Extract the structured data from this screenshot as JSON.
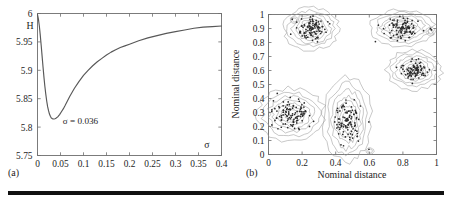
{
  "figure": {
    "bottom_rule_color": "#111111",
    "background": "#ffffff"
  },
  "panel_a": {
    "caption": "(a)",
    "y_axis_symbol": "H",
    "x_axis_symbol": "σ",
    "annotation": "σ = 0.036",
    "x_ticks": [
      "0",
      "0.05",
      "0.1",
      "0.15",
      "0.2",
      "0.25",
      "0.3",
      "0.35",
      "0.4"
    ],
    "y_ticks": [
      "5.75",
      "5.8",
      "5.85",
      "5.9",
      "5.95",
      "6"
    ]
  },
  "panel_b": {
    "caption": "(b)",
    "x_title": "Nominal distance",
    "y_title": "Nominal distance",
    "x_ticks": [
      "0",
      "0.2",
      "0.4",
      "0.6",
      "0.8",
      "1"
    ],
    "y_ticks": [
      "0",
      "0.1",
      "0.2",
      "0.3",
      "0.4",
      "0.5",
      "0.6",
      "0.7",
      "0.8",
      "0.9",
      "1"
    ]
  },
  "chart_data": [
    {
      "type": "line",
      "panel": "(a)",
      "title": "",
      "xlabel": "σ",
      "ylabel": "H",
      "xlim": [
        0,
        0.4
      ],
      "ylim": [
        5.75,
        6.0
      ],
      "grid": false,
      "legend": null,
      "annotations": [
        {
          "text": "σ = 0.036",
          "x": 0.055,
          "y": 5.805,
          "note": "marks the location of the curve minimum"
        }
      ],
      "series": [
        {
          "name": "H(σ)",
          "color": "#585858",
          "x": [
            0.0,
            0.002,
            0.004,
            0.006,
            0.008,
            0.01,
            0.012,
            0.014,
            0.016,
            0.018,
            0.02,
            0.022,
            0.024,
            0.026,
            0.028,
            0.03,
            0.032,
            0.034,
            0.036,
            0.038,
            0.04,
            0.044,
            0.048,
            0.052,
            0.056,
            0.06,
            0.065,
            0.07,
            0.075,
            0.08,
            0.09,
            0.1,
            0.11,
            0.12,
            0.13,
            0.14,
            0.15,
            0.16,
            0.17,
            0.18,
            0.19,
            0.2,
            0.22,
            0.24,
            0.26,
            0.28,
            0.3,
            0.32,
            0.34,
            0.36,
            0.38,
            0.4
          ],
          "y": [
            5.998,
            5.99,
            5.978,
            5.962,
            5.944,
            5.925,
            5.906,
            5.888,
            5.872,
            5.858,
            5.846,
            5.836,
            5.829,
            5.823,
            5.819,
            5.816,
            5.815,
            5.8145,
            5.8143,
            5.8147,
            5.8155,
            5.818,
            5.822,
            5.827,
            5.832,
            5.838,
            5.846,
            5.854,
            5.861,
            5.868,
            5.88,
            5.891,
            5.9,
            5.908,
            5.915,
            5.921,
            5.927,
            5.932,
            5.936,
            5.94,
            5.943,
            5.946,
            5.952,
            5.957,
            5.961,
            5.965,
            5.968,
            5.971,
            5.974,
            5.976,
            5.977,
            5.978
          ]
        }
      ],
      "minimum": {
        "x": 0.036,
        "y": 5.8143
      }
    },
    {
      "type": "scatter",
      "panel": "(b)",
      "title": "",
      "xlabel": "Nominal distance",
      "ylabel": "Nominal distance",
      "xlim": [
        0,
        1
      ],
      "ylim": [
        0,
        1
      ],
      "grid": false,
      "legend": null,
      "overlay": "kernel density contours around each cluster",
      "clusters": [
        {
          "name": "lower-left",
          "center": [
            0.135,
            0.285
          ],
          "spread": [
            0.085,
            0.08
          ],
          "n": 110
        },
        {
          "name": "middle",
          "center": [
            0.47,
            0.25
          ],
          "spread": [
            0.06,
            0.13
          ],
          "n": 105
        },
        {
          "name": "upper-left",
          "center": [
            0.255,
            0.9
          ],
          "spread": [
            0.07,
            0.065
          ],
          "n": 100
        },
        {
          "name": "upper-right",
          "center": [
            0.795,
            0.905
          ],
          "spread": [
            0.08,
            0.055
          ],
          "n": 95
        },
        {
          "name": "right",
          "center": [
            0.87,
            0.605
          ],
          "spread": [
            0.07,
            0.06
          ],
          "n": 90
        },
        {
          "name": "outlier-top-left",
          "center": [
            0.155,
            0.96
          ],
          "spread": [
            0.012,
            0.012
          ],
          "n": 2
        },
        {
          "name": "outlier-top-right",
          "center": [
            0.965,
            0.88
          ],
          "spread": [
            0.015,
            0.015
          ],
          "n": 2
        },
        {
          "name": "outlier-bottom",
          "center": [
            0.605,
            0.025
          ],
          "spread": [
            0.012,
            0.012
          ],
          "n": 1
        }
      ],
      "point_color": "#2b2b2b",
      "contour_color": "#9a9a9a"
    }
  ]
}
